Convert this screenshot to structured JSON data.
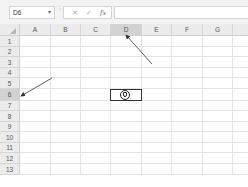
{
  "formula_bar": {
    "name_box": "D6",
    "name_box_arrow": "▾",
    "separator": "⋮",
    "cancel_icon": "✕",
    "enter_icon": "✓",
    "fx_label": "fx",
    "formula_value": ""
  },
  "sheet": {
    "columns": [
      "A",
      "B",
      "C",
      "D",
      "E",
      "F",
      "G"
    ],
    "rows": [
      "1",
      "2",
      "3",
      "4",
      "5",
      "6",
      "7",
      "8",
      "9",
      "10",
      "11",
      "12",
      "13"
    ],
    "selected_cell": "D6",
    "selected_column": "D",
    "selected_row": "6"
  },
  "annotations": {
    "arrow_color": "#333333",
    "arrows": [
      {
        "target": "row-header-6"
      },
      {
        "target": "column-header-D"
      }
    ]
  },
  "colors": {
    "header_bg": "#ececec",
    "header_selected_bg": "#d2d2d2",
    "gridline": "#e4e4e4",
    "selection_border": "#333333"
  }
}
